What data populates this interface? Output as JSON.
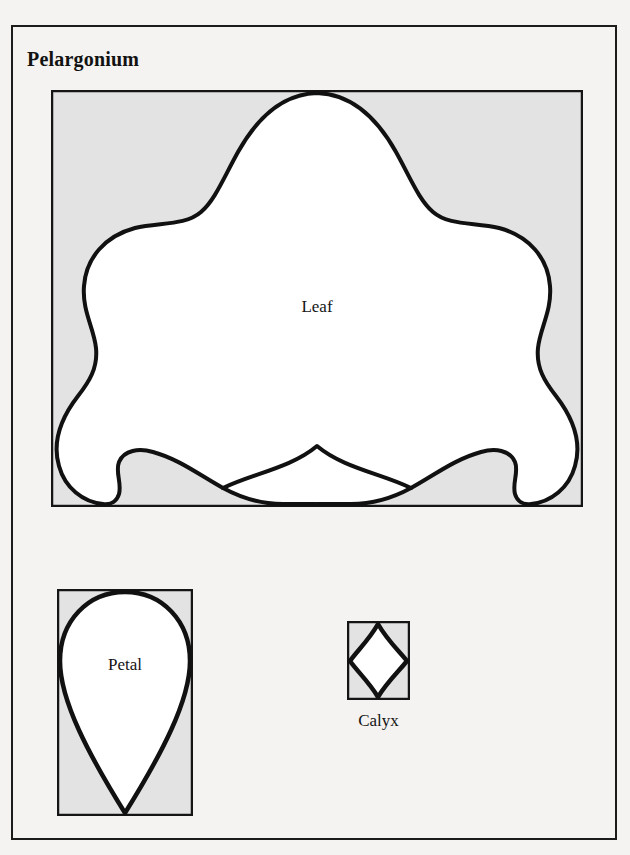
{
  "plate": {
    "title": "Pelargonium",
    "background_color": "#f4f3f1",
    "frame_color": "#1b1b1b",
    "box_fill_color": "#e3e3e3",
    "shape_fill_color": "#ffffff",
    "outline_color": "#111111"
  },
  "figures": [
    {
      "id": "leaf",
      "caption": "Leaf",
      "shape": "lobed-palmate-leaf",
      "caption_position": "inside-center",
      "box": {
        "x": 51,
        "y": 90,
        "width": 532,
        "height": 417
      }
    },
    {
      "id": "petal",
      "caption": "Petal",
      "shape": "inverted-teardrop",
      "caption_position": "inside-upper",
      "box": {
        "x": 57,
        "y": 589,
        "width": 136,
        "height": 227
      }
    },
    {
      "id": "calyx",
      "caption": "Calyx",
      "shape": "convex-diamond",
      "caption_position": "below",
      "box": {
        "x": 347,
        "y": 621,
        "width": 63,
        "height": 79
      }
    }
  ]
}
